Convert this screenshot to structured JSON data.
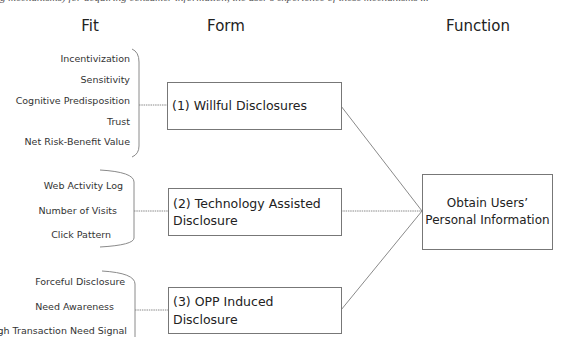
{
  "caption_cut": "g mechanisms) for acquiring consumer information, the user's experience of these mechanisms ...",
  "headers": {
    "fit": "Fit",
    "form": "Form",
    "function": "Function"
  },
  "fit_groups": [
    {
      "items": [
        "Incentivization",
        "Sensitivity",
        "Cognitive Predisposition",
        "Trust",
        "Net Risk-Benefit Value"
      ]
    },
    {
      "items": [
        "Web Activity Log",
        "Number of Visits",
        "Click Pattern"
      ]
    },
    {
      "items": [
        "Forceful Disclosure",
        "Need Awareness",
        "High Transaction Need Signal"
      ]
    }
  ],
  "forms": [
    {
      "label": "(1) Willful Disclosures"
    },
    {
      "label": "(2) Technology Assisted Disclosure"
    },
    {
      "label": "(3) OPP Induced Disclosure"
    }
  ],
  "function": {
    "line1": "Obtain Users’",
    "line2": "Personal Information"
  },
  "colors": {
    "line": "#8a8a8a",
    "box_border": "#777777",
    "text": "#222222"
  }
}
